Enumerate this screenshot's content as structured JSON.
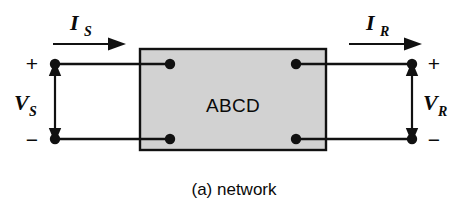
{
  "figure": {
    "caption": "(a) network",
    "box_label": "ABCD",
    "colors": {
      "background": "#ffffff",
      "box_fill": "#d2d2d2",
      "box_stroke": "#111111",
      "wire": "#111111",
      "text": "#0a0a0a"
    }
  },
  "currents": [
    {
      "id": "source-current",
      "symbol": "I",
      "subscript": "S",
      "direction": "right",
      "side": "left"
    },
    {
      "id": "receiving-current",
      "symbol": "I",
      "subscript": "R",
      "direction": "right",
      "side": "right"
    }
  ],
  "voltages": [
    {
      "id": "source-voltage",
      "symbol": "V",
      "subscript": "S",
      "side": "left",
      "plus_label": "+",
      "minus_label": "−"
    },
    {
      "id": "receiving-voltage",
      "symbol": "V",
      "subscript": "R",
      "side": "right",
      "plus_label": "+",
      "minus_label": "−"
    }
  ],
  "terminals": {
    "left_top": "+",
    "left_bottom": "−",
    "right_top": "+",
    "right_bottom": "−"
  }
}
